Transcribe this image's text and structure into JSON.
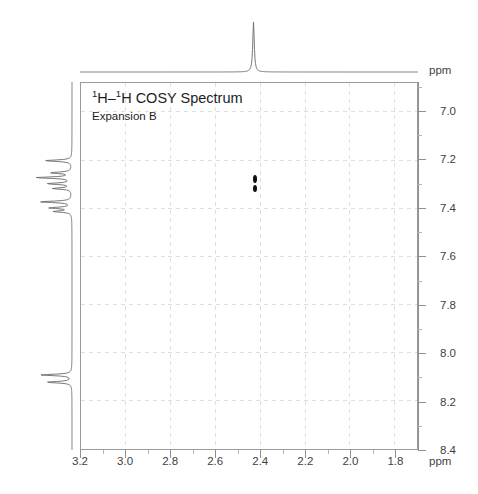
{
  "figure": {
    "title_html_parts": {
      "sup1": "1",
      "h1": "H–",
      "sup2": "1",
      "h2": "H COSY Spectrum"
    },
    "title_text": "1H–1H COSY Spectrum",
    "subtitle": "Expansion B",
    "ppm_top_label": "ppm",
    "ppm_bottom_label": "ppm"
  },
  "chart_data": {
    "type": "heatmap",
    "title": "1H–1H COSY Spectrum",
    "subtitle": "Expansion B",
    "xlabel": "ppm",
    "ylabel": "ppm",
    "grid": true,
    "legend_position": "none",
    "xlim": [
      3.2,
      1.7
    ],
    "ylim": [
      6.88,
      8.4
    ],
    "x_axis_reversed": true,
    "y_axis_reversed": true,
    "x_ticks": [
      3.2,
      3.0,
      2.8,
      2.6,
      2.4,
      2.2,
      2.0,
      1.8
    ],
    "x_tick_labels": [
      "3.2",
      "3.0",
      "2.8",
      "2.6",
      "2.4",
      "2.2",
      "2.0",
      "1.8"
    ],
    "x_minor_ticks": [
      3.1,
      2.9,
      2.7,
      2.5,
      2.3,
      2.1,
      1.9
    ],
    "y_ticks": [
      7.0,
      7.2,
      7.4,
      7.6,
      7.8,
      8.0,
      8.2,
      8.4
    ],
    "y_tick_labels": [
      "7.0",
      "7.2",
      "7.4",
      "7.6",
      "7.8",
      "8.0",
      "8.2",
      "8.4"
    ],
    "y_minor_ticks": [
      6.9,
      7.1,
      7.3,
      7.5,
      7.7,
      7.9,
      8.1,
      8.3
    ],
    "cross_peaks": [
      {
        "f2_ppm": 2.43,
        "f1_ppm": 7.275,
        "rx": 2.0,
        "ry": 4.0,
        "intensity": "strong"
      },
      {
        "f2_ppm": 2.43,
        "f1_ppm": 7.315,
        "rx": 2.0,
        "ry": 3.5,
        "intensity": "strong"
      }
    ],
    "projection_f2": {
      "axis": "top",
      "peaks": [
        {
          "ppm": 2.43,
          "height": 1.0
        }
      ]
    },
    "projection_f1": {
      "axis": "left",
      "peaks": [
        {
          "ppm": 7.205,
          "height": 0.62
        },
        {
          "ppm": 7.255,
          "height": 0.48
        },
        {
          "ppm": 7.275,
          "height": 0.8
        },
        {
          "ppm": 7.3,
          "height": 0.55
        },
        {
          "ppm": 7.32,
          "height": 0.42
        },
        {
          "ppm": 7.375,
          "height": 0.72
        },
        {
          "ppm": 7.4,
          "height": 0.5
        },
        {
          "ppm": 7.415,
          "height": 0.4
        },
        {
          "ppm": 8.09,
          "height": 0.7
        },
        {
          "ppm": 8.12,
          "height": 0.58
        }
      ]
    }
  },
  "colors": {
    "background": "#ffffff",
    "axis": "#8f8f8f",
    "grid": "#dedede",
    "trace": "#5a5a5a",
    "peak": "#101010",
    "text": "#3f3f3f"
  }
}
